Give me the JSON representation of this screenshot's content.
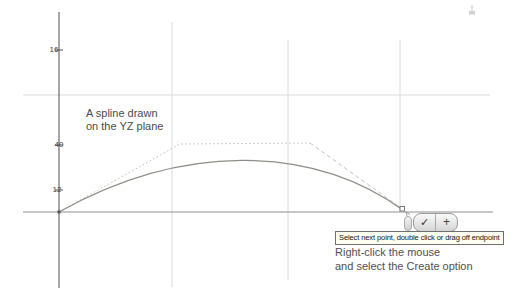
{
  "sketch": {
    "annotation": {
      "line1": "A spline drawn",
      "line2": "on the YZ plane"
    },
    "dimensions": [
      {
        "value": "16"
      },
      {
        "value": "40"
      },
      {
        "value": "12"
      }
    ],
    "tooltip_text": "Select next point, double click or drag off endpoint",
    "instructions": {
      "line1": "Right-click the mouse",
      "line2": "and select the Create option"
    },
    "mini_toolbar": {
      "confirm_icon": "✓",
      "add_icon": "+"
    },
    "colors": {
      "axis_vertical": "#4f4f4f",
      "axis_horizontal": "#8f8f8f",
      "grid_line": "#dcdcdc",
      "spline": "#8e8e88",
      "construction_dotted": "#bdbdbd",
      "annotation_text": "#4a4a4a",
      "tooltip_background": "#fdfdf2",
      "tooltip_border": "#6f6f6f"
    },
    "spline_control_points": [
      [
        59,
        212
      ],
      [
        180,
        144
      ],
      [
        310,
        143
      ],
      [
        403,
        210
      ]
    ]
  }
}
